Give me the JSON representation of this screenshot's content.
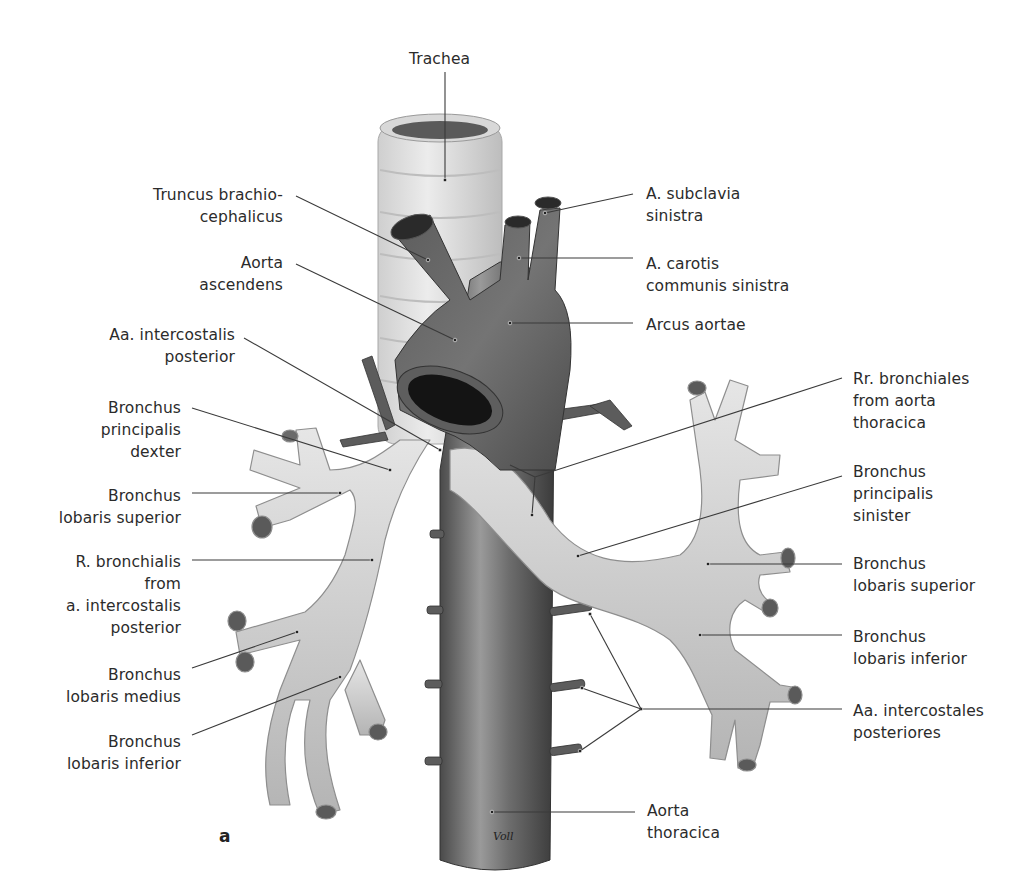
{
  "figure": {
    "panel_letter": "a",
    "signature": "Voll",
    "colors": {
      "background": "#ffffff",
      "label_text": "#2b2b2b",
      "leader_line": "#3a3a3a",
      "aorta_dark": "#3f3f3f",
      "aorta_mid": "#6d6d6d",
      "aorta_light": "#9a9a9a",
      "bronchus_light": "#e2e2e2",
      "bronchus_mid": "#c4c4c4",
      "bronchus_shadow": "#9c9c9c",
      "lumen": "#1e1e1e"
    },
    "labels": [
      {
        "id": "trachea",
        "lines": [
          "Trachea"
        ],
        "x": 409,
        "y": 48,
        "align": "left",
        "leader": [
          [
            445,
            72
          ],
          [
            445,
            180
          ]
        ]
      },
      {
        "id": "truncus-brachiocephalicus",
        "lines": [
          "Truncus brachio-",
          "cephalicus"
        ],
        "x": 130,
        "y": 184,
        "align": "right",
        "w": 153,
        "leader": [
          [
            296,
            196
          ],
          [
            428,
            260
          ]
        ]
      },
      {
        "id": "aorta-ascendens",
        "lines": [
          "Aorta",
          "ascendens"
        ],
        "x": 190,
        "y": 252,
        "align": "right",
        "w": 93,
        "leader": [
          [
            296,
            264
          ],
          [
            455,
            340
          ]
        ]
      },
      {
        "id": "aa-intercostalis-posterior-left",
        "lines": [
          "Aa. intercostalis",
          "posterior"
        ],
        "x": 96,
        "y": 324,
        "align": "right",
        "w": 139,
        "leader": [
          [
            244,
            338
          ],
          [
            440,
            450
          ]
        ]
      },
      {
        "id": "bronchus-principalis-dexter",
        "lines": [
          "Bronchus",
          "principalis",
          "dexter"
        ],
        "x": 90,
        "y": 397,
        "align": "right",
        "w": 91,
        "leader": [
          [
            192,
            408
          ],
          [
            390,
            470
          ]
        ]
      },
      {
        "id": "bronchus-lobaris-superior-right",
        "lines": [
          "Bronchus",
          "lobaris superior"
        ],
        "x": 48,
        "y": 485,
        "align": "right",
        "w": 133,
        "leader": [
          [
            192,
            493
          ],
          [
            340,
            493
          ]
        ]
      },
      {
        "id": "r-bronchialis",
        "lines": [
          "R. bronchialis",
          "from",
          "a. intercostalis",
          "posterior"
        ],
        "x": 56,
        "y": 551,
        "align": "right",
        "w": 125,
        "leader": [
          [
            192,
            560
          ],
          [
            372,
            560
          ]
        ]
      },
      {
        "id": "bronchus-lobaris-medius",
        "lines": [
          "Bronchus",
          "lobaris medius"
        ],
        "x": 56,
        "y": 664,
        "align": "right",
        "w": 125,
        "leader": [
          [
            192,
            668
          ],
          [
            297,
            632
          ]
        ]
      },
      {
        "id": "bronchus-lobaris-inferior-right",
        "lines": [
          "Bronchus",
          "lobaris inferior"
        ],
        "x": 56,
        "y": 731,
        "align": "right",
        "w": 125,
        "leader": [
          [
            192,
            735
          ],
          [
            340,
            677
          ]
        ]
      },
      {
        "id": "a-subclavia-sinistra",
        "lines": [
          "A. subclavia",
          "sinistra"
        ],
        "x": 646,
        "y": 183,
        "align": "left",
        "leader": [
          [
            633,
            194
          ],
          [
            545,
            213
          ]
        ]
      },
      {
        "id": "a-carotis-communis-sinistra",
        "lines": [
          "A. carotis",
          "communis sinistra"
        ],
        "x": 646,
        "y": 253,
        "align": "left",
        "leader": [
          [
            633,
            258
          ],
          [
            519,
            258
          ]
        ]
      },
      {
        "id": "arcus-aortae",
        "lines": [
          "Arcus aortae"
        ],
        "x": 646,
        "y": 314,
        "align": "left",
        "leader": [
          [
            633,
            323
          ],
          [
            510,
            323
          ]
        ]
      },
      {
        "id": "rr-bronchiales",
        "lines": [
          "Rr. bronchiales",
          "from aorta",
          "thoracica"
        ],
        "x": 853,
        "y": 368,
        "align": "left",
        "leader": [
          [
            842,
            378
          ],
          [
            535,
            477
          ],
          [
            510,
            465
          ],
          [
            535,
            477
          ],
          [
            532,
            515
          ]
        ]
      },
      {
        "id": "bronchus-principalis-sinister",
        "lines": [
          "Bronchus",
          "principalis",
          "sinister"
        ],
        "x": 853,
        "y": 461,
        "align": "left",
        "leader": [
          [
            842,
            476
          ],
          [
            578,
            556
          ]
        ]
      },
      {
        "id": "bronchus-lobaris-superior-left",
        "lines": [
          "Bronchus",
          "lobaris superior"
        ],
        "x": 853,
        "y": 553,
        "align": "left",
        "leader": [
          [
            842,
            564
          ],
          [
            708,
            564
          ]
        ]
      },
      {
        "id": "bronchus-lobaris-inferior-left",
        "lines": [
          "Bronchus",
          "lobaris inferior"
        ],
        "x": 853,
        "y": 626,
        "align": "left",
        "leader": [
          [
            842,
            635
          ],
          [
            700,
            635
          ]
        ]
      },
      {
        "id": "aa-intercostales-posteriores",
        "lines": [
          "Aa. intercostales",
          "posteriores"
        ],
        "x": 853,
        "y": 700,
        "align": "left",
        "leader": [
          [
            842,
            709
          ],
          [
            641,
            709
          ]
        ],
        "fan": [
          [
            [
              641,
              709
            ],
            [
              590,
              614
            ]
          ],
          [
            [
              641,
              709
            ],
            [
              582,
              688
            ]
          ],
          [
            [
              641,
              709
            ],
            [
              580,
              751
            ]
          ]
        ]
      },
      {
        "id": "aorta-thoracica",
        "lines": [
          "Aorta",
          "thoracica"
        ],
        "x": 647,
        "y": 800,
        "align": "left",
        "leader": [
          [
            635,
            812
          ],
          [
            492,
            812
          ]
        ]
      }
    ]
  }
}
